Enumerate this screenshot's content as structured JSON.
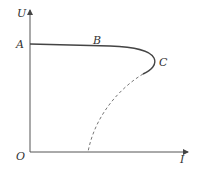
{
  "diagram": {
    "type": "U-I characteristic curve",
    "axes": {
      "y_label": "U",
      "x_label": "I",
      "origin_label": "O"
    },
    "points": {
      "A": "A",
      "B": "B",
      "C": "C"
    },
    "curves": [
      {
        "name": "solid-curve-A-B-C",
        "style": "solid",
        "description": "nearly horizontal from A through B, bending back at C"
      },
      {
        "name": "dashed-curve-C-to-I-axis",
        "style": "dashed",
        "description": "continues from C down to the I axis"
      }
    ],
    "colors": {
      "line": "#444444",
      "dashed": "#777777",
      "text": "#333333"
    }
  }
}
